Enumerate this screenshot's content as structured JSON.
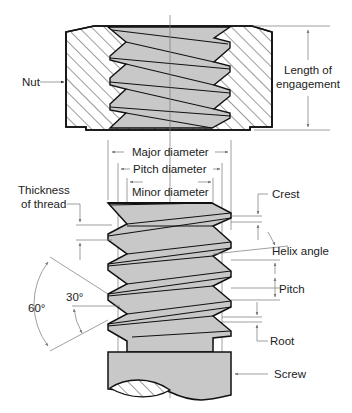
{
  "diagram": {
    "labels": {
      "nut": "Nut",
      "length_line1": "Length of",
      "length_line2": "engagement",
      "major_diameter": "Major diameter",
      "pitch_diameter": "Pitch diameter",
      "minor_diameter": "Minor diameter",
      "thickness_line1": "Thickness",
      "thickness_line2": "of thread",
      "crest": "Crest",
      "helix_angle": "Helix angle",
      "pitch": "Pitch",
      "root": "Root",
      "screw": "Screw",
      "angle_60": "60°",
      "angle_30": "30°"
    },
    "colors": {
      "outline": "#111111",
      "thread_fill": "#c8c8c8",
      "dimension_line": "#777777",
      "background": "#ffffff"
    }
  }
}
